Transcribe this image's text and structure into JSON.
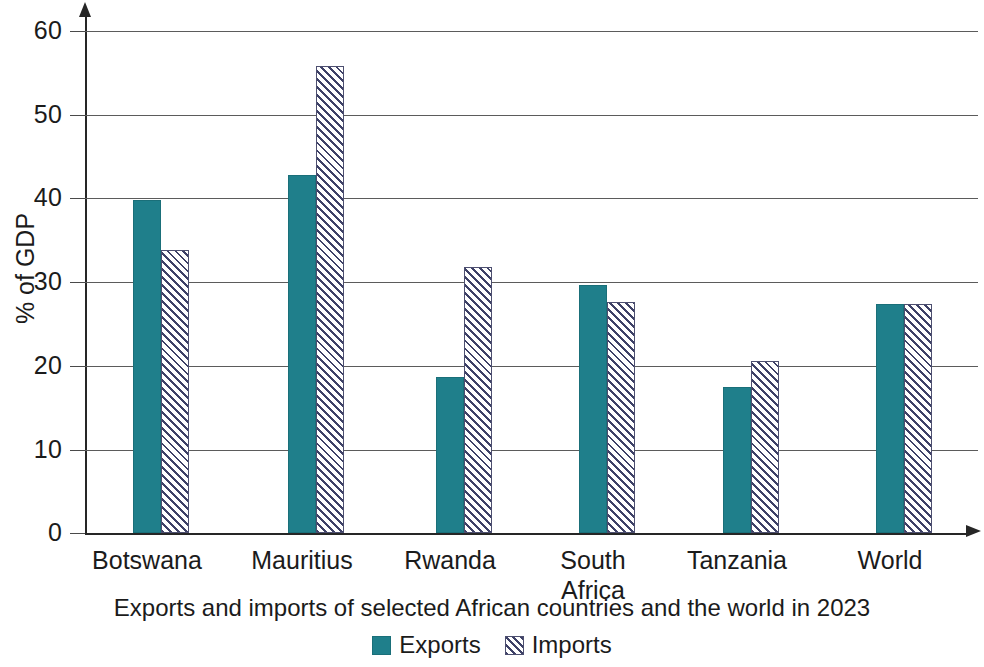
{
  "chart_data": {
    "type": "bar",
    "title": "",
    "caption": "Exports and imports of selected African countries and the world in 2023",
    "xlabel": "",
    "ylabel": "% of GDP",
    "ylim": [
      0,
      60
    ],
    "ytick_labels": [
      "60",
      "50",
      "40",
      "30",
      "20",
      "10",
      "0"
    ],
    "ytick_values": [
      60,
      50,
      40,
      30,
      20,
      10,
      0
    ],
    "grid": true,
    "grid_axis": "y",
    "legend_position": "bottom-center",
    "categories": [
      "Botswana",
      "Mauritius",
      "Rwanda",
      "South\nAfrica",
      "Tanzania",
      "World"
    ],
    "series": [
      {
        "name": "Exports",
        "color": "#1f7f8b",
        "fill": "solid",
        "values": [
          39.8,
          42.8,
          18.7,
          29.6,
          17.5,
          27.4
        ]
      },
      {
        "name": "Imports",
        "color": "#3e4167",
        "fill": "diagonal-hatch",
        "values": [
          33.8,
          55.8,
          31.8,
          27.6,
          20.6,
          27.4
        ]
      }
    ]
  },
  "axes": {
    "y_title": "% of GDP"
  },
  "legend": {
    "items": [
      {
        "label": "Exports",
        "swatch": "solid-teal-swatch"
      },
      {
        "label": "Imports",
        "swatch": "hatched-swatch"
      }
    ]
  }
}
